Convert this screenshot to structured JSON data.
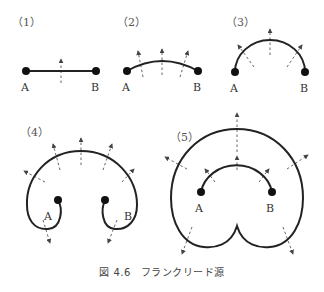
{
  "figure": {
    "caption_number": "図 4.6",
    "caption_title": "フランクリード源",
    "panels": [
      {
        "label": "（1）",
        "point_a": "A",
        "point_b": "B"
      },
      {
        "label": "（2）",
        "point_a": "A",
        "point_b": "B"
      },
      {
        "label": "（3）",
        "point_a": "A",
        "point_b": "B"
      },
      {
        "label": "（4）",
        "point_a": "A",
        "point_b": "B"
      },
      {
        "label": "（5）",
        "point_a": "A",
        "point_b": "B"
      }
    ]
  },
  "colors": {
    "line": "#222222",
    "arrow": "#666666",
    "text": "#333333",
    "background": "#ffffff"
  }
}
